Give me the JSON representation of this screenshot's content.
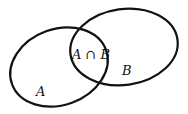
{
  "diagram": {
    "type": "venn",
    "colors": {
      "stroke": "#111111",
      "background": "#ffffff"
    },
    "sets": [
      {
        "id": "A",
        "label": "A"
      },
      {
        "id": "B",
        "label": "B"
      }
    ],
    "intersection_label": "A ∩ B"
  }
}
